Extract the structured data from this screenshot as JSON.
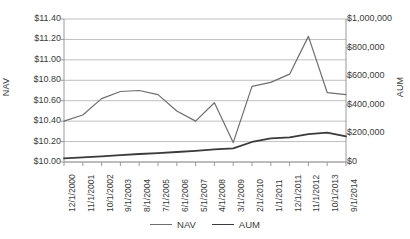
{
  "chart_data": {
    "type": "line",
    "title": "",
    "xlabel": "",
    "grid": true,
    "legend_position": "bottom",
    "categories": [
      "12/1/2000",
      "11/1/2001",
      "10/1/2002",
      "9/1/2003",
      "8/1/2004",
      "7/1/2005",
      "6/1/2006",
      "5/1/2007",
      "4/1/2008",
      "3/1/2009",
      "2/1/2010",
      "1/1/2011",
      "12/1/2011",
      "11/1/2012",
      "10/1/2013",
      "9/1/2014"
    ],
    "axes": {
      "left": {
        "label": "NAV",
        "ylim": [
          10.0,
          11.4
        ],
        "ticks": [
          "$10.00",
          "$10.20",
          "$10.40",
          "$10.60",
          "$10.80",
          "$11.00",
          "$11.20",
          "$11.40"
        ],
        "tick_values": [
          10.0,
          10.2,
          10.4,
          10.6,
          10.8,
          11.0,
          11.2,
          11.4
        ]
      },
      "right": {
        "label": "AUM",
        "ylim": [
          0,
          1000000
        ],
        "ticks": [
          "$0",
          "$200,000",
          "$400,000",
          "$600,000",
          "$800,000",
          "$1,000,000"
        ],
        "tick_values": [
          0,
          200000,
          400000,
          600000,
          800000,
          1000000
        ]
      }
    },
    "series": [
      {
        "name": "NAV",
        "axis": "left",
        "color": "#6e6e6e",
        "values": [
          10.4,
          10.46,
          10.62,
          10.69,
          10.7,
          10.66,
          10.5,
          10.4,
          10.58,
          10.19,
          10.74,
          10.78,
          10.86,
          11.23,
          10.68,
          10.66
        ]
      },
      {
        "name": "AUM",
        "axis": "right",
        "color": "#3a3a3a",
        "values": [
          25000,
          32000,
          40000,
          48000,
          56000,
          62000,
          70000,
          78000,
          88000,
          95000,
          140000,
          165000,
          172000,
          195000,
          205000,
          180000
        ]
      }
    ]
  },
  "legend": {
    "items": [
      {
        "label": "NAV",
        "key": "nav"
      },
      {
        "label": "AUM",
        "key": "aum"
      }
    ]
  }
}
